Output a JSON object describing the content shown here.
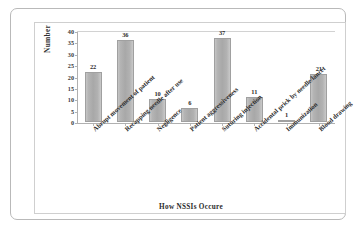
{
  "chart_data": {
    "type": "bar",
    "title": "",
    "xlabel": "How  NSSIs Occure",
    "ylabel": "Number",
    "ylim": [
      0,
      40
    ],
    "ytick_step": 5,
    "yticks": [
      "40",
      "35",
      "30",
      "25",
      "20",
      "15",
      "10",
      "5",
      "0"
    ],
    "grid": false,
    "legend": "none",
    "bar_color": "#aeaeae",
    "categories": [
      "Abrupt movement of patient",
      "Recapping needle after use",
      "Negligence",
      "Patient aggressiveness",
      "Suturing injection",
      "Accidental prick by needle/lancet",
      "Immunization",
      "Blood drawing"
    ],
    "values": [
      22,
      36,
      10,
      6,
      37,
      11,
      1,
      21
    ],
    "data_labels": [
      "22",
      "36",
      "10",
      "6",
      "37",
      "11",
      "1",
      "21"
    ]
  },
  "figure": {
    "frame_color": "#b9b9b9",
    "panel_color": "#cfcfcf",
    "background": "#ffffff"
  }
}
